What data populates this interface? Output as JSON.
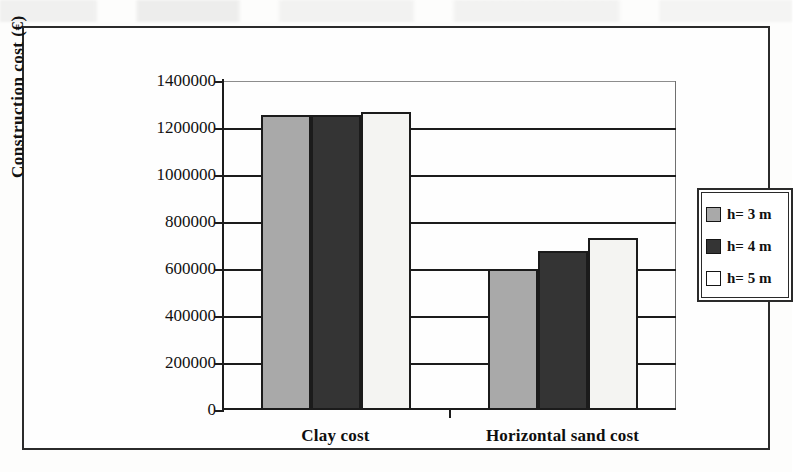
{
  "chart_data": {
    "type": "bar",
    "title": "",
    "xlabel": "",
    "ylabel": "Construction cost (€)",
    "categories": [
      "Clay cost",
      "Horizontal sand cost"
    ],
    "series": [
      {
        "name": "h= 3 m",
        "values": [
          1255000,
          600000
        ],
        "color": "#a9a9a9"
      },
      {
        "name": "h= 4 m",
        "values": [
          1255000,
          675000
        ],
        "color": "#343434"
      },
      {
        "name": "h= 5 m",
        "values": [
          1270000,
          730000
        ],
        "color": "#f4f4f2"
      }
    ],
    "ylim": [
      0,
      1400000
    ],
    "ytick_step": 200000,
    "ytick_labels": [
      "1400000",
      "1200000",
      "1000000",
      "800000",
      "600000",
      "400000",
      "200000",
      "0"
    ],
    "ytick_values": [
      1400000,
      1200000,
      1000000,
      800000,
      600000,
      400000,
      200000,
      0
    ],
    "grid": "horizontal",
    "legend_position": "right"
  },
  "legend": {
    "items": [
      {
        "label": "h= 3 m"
      },
      {
        "label": "h= 4 m"
      },
      {
        "label": "h= 5 m"
      }
    ]
  },
  "ghost_text": {
    "line1": "",
    "line2": "",
    "line3": "",
    "line4": ""
  }
}
